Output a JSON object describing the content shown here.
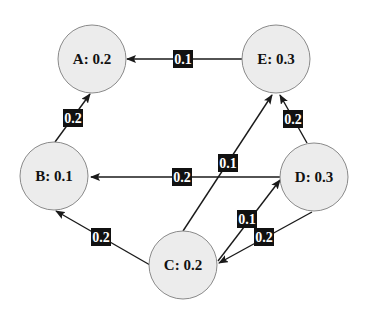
{
  "colors": {
    "node_fill": "#ececec",
    "node_stroke": "#8a8a8a",
    "edge": "#1a1a1a",
    "edge_label_bg": "#111111",
    "edge_label_text": "#ffffff",
    "node_text": "#111111"
  },
  "nodes": [
    {
      "id": "A",
      "label": "A: 0.2",
      "cx": 92,
      "cy": 59,
      "r": 34
    },
    {
      "id": "E",
      "label": "E: 0.3",
      "cx": 276,
      "cy": 59,
      "r": 34
    },
    {
      "id": "B",
      "label": "B: 0.1",
      "cx": 54,
      "cy": 176,
      "r": 34
    },
    {
      "id": "D",
      "label": "D: 0.3",
      "cx": 314,
      "cy": 177,
      "r": 34
    },
    {
      "id": "C",
      "label": "C: 0.2",
      "cx": 183,
      "cy": 265,
      "r": 34
    }
  ],
  "edges": [
    {
      "from": "E",
      "to": "A",
      "weight": "0.1",
      "x1": 242,
      "y1": 59,
      "x2": 127,
      "y2": 59,
      "lx": 183,
      "ly": 59
    },
    {
      "from": "B",
      "to": "A",
      "weight": "0.2",
      "x1": 55,
      "y1": 142,
      "x2": 90,
      "y2": 94,
      "lx": 73,
      "ly": 118
    },
    {
      "from": "D",
      "to": "E",
      "weight": "0.2",
      "x1": 307,
      "y1": 143,
      "x2": 280,
      "y2": 95,
      "lx": 293,
      "ly": 119
    },
    {
      "from": "C",
      "to": "E",
      "weight": "0.1",
      "x1": 183,
      "y1": 231,
      "x2": 272,
      "y2": 95,
      "lx": 228,
      "ly": 163
    },
    {
      "from": "D",
      "to": "B",
      "weight": "0.2",
      "x1": 280,
      "y1": 177,
      "x2": 91,
      "y2": 177,
      "lx": 182,
      "ly": 177
    },
    {
      "from": "C",
      "to": "B",
      "weight": "0.2",
      "x1": 150,
      "y1": 265,
      "x2": 56,
      "y2": 211,
      "lx": 101,
      "ly": 237
    },
    {
      "from": "C",
      "to": "D",
      "weight": "0.1",
      "x1": 218,
      "y1": 261,
      "x2": 280,
      "y2": 180,
      "lx": 247,
      "ly": 219
    },
    {
      "from": "D",
      "to": "C",
      "weight": "0.2",
      "x1": 312,
      "y1": 212,
      "x2": 219,
      "y2": 263,
      "lx": 264,
      "ly": 237
    }
  ]
}
